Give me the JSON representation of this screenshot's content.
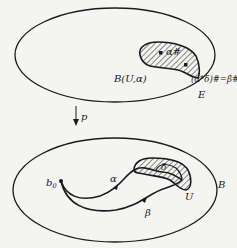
{
  "diagram": {
    "top_space": {
      "label": "E",
      "region_label": "B(U,α)",
      "point_1": "α#",
      "point_2": "(α*δ)#=β#"
    },
    "projection": {
      "label": "p"
    },
    "bottom_space": {
      "label": "B",
      "basepoint": "b",
      "basepoint_sub": "0",
      "path_1": "α",
      "path_2": "β",
      "region_label": "U",
      "inner_label": "δ"
    },
    "colors": {
      "ink": "#1a1a1a",
      "background": "#f4f4f2"
    }
  }
}
